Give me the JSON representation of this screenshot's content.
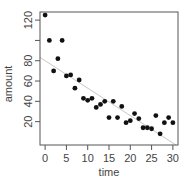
{
  "chart_data": {
    "type": "scatter",
    "title": "",
    "xlabel": "time",
    "ylabel": "amount",
    "xlim": [
      -1.2,
      31.2
    ],
    "ylim": [
      -3,
      128
    ],
    "xticks": [
      0,
      5,
      10,
      15,
      20,
      25,
      30
    ],
    "yticks": [
      20,
      40,
      60,
      80,
      100,
      120
    ],
    "grid": false,
    "legend": null,
    "series": [
      {
        "name": "observations",
        "x": [
          0,
          1,
          2,
          3,
          4,
          5,
          6,
          7,
          8,
          9,
          10,
          11,
          12,
          13,
          14,
          15,
          16,
          17,
          18,
          19,
          20,
          21,
          22,
          23,
          24,
          25,
          26,
          27,
          28,
          29,
          30
        ],
        "y": [
          125,
          100,
          70,
          82,
          100,
          65,
          66,
          53,
          61,
          43,
          41,
          43,
          34,
          37,
          40,
          24,
          40,
          24,
          35,
          19,
          21,
          28,
          23,
          14,
          14,
          13,
          26,
          8,
          19,
          24,
          19
        ]
      }
    ],
    "fit_line": {
      "type": "linear",
      "intercept": 80,
      "slope": -2.7
    }
  },
  "colors": {
    "points": "#111111",
    "fit_line": "#c8c8c8",
    "frame": "#555555",
    "text": "#444444"
  }
}
